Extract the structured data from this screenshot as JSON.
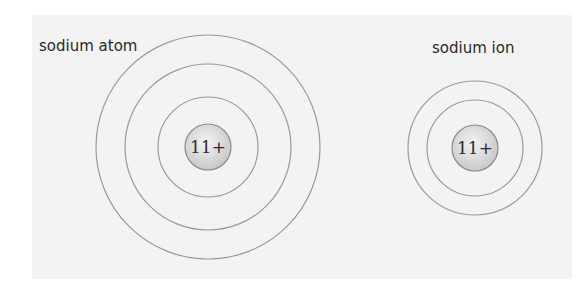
{
  "diagram": {
    "colors": {
      "background": "#f3f3f3",
      "shell_stroke": "#9a9a9a",
      "electron": "#a3a3a3",
      "nucleus_fill_light": "#f4f4f4",
      "nucleus_fill_dark": "#c8c8c8",
      "nucleus_stroke": "#8a8a8a"
    },
    "atom": {
      "label": "sodium atom",
      "nucleus_label": "11+",
      "center": [
        208,
        147
      ],
      "shells": [
        {
          "radius": 50,
          "electrons": 2
        },
        {
          "radius": 83,
          "electrons": 8
        },
        {
          "radius": 112,
          "electrons": 1
        }
      ],
      "electron_configuration": "2,8,1"
    },
    "ion": {
      "label": "sodium ion",
      "nucleus_label": "11+",
      "center": [
        475,
        147
      ],
      "shells": [
        {
          "radius": 47,
          "electrons": 2
        },
        {
          "radius": 67,
          "electrons": 8
        }
      ],
      "electron_configuration": "2,8"
    },
    "electron_symbol": "×"
  }
}
